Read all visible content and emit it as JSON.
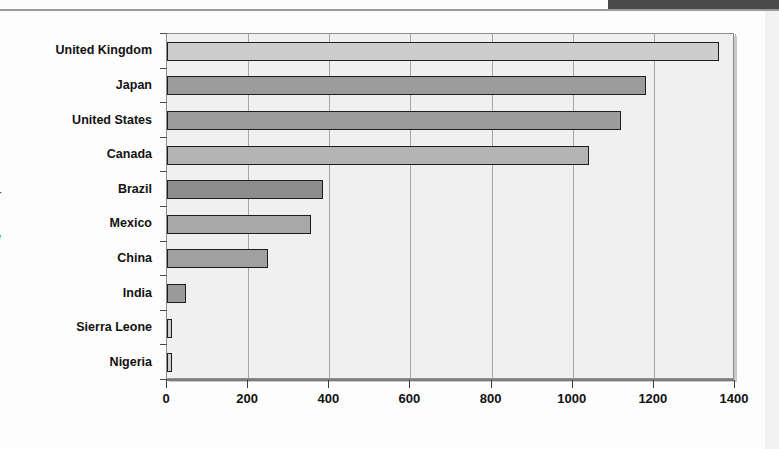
{
  "page": {
    "background_color": "#fdfdfd",
    "top_band_color": "#4a4a4a",
    "edge_glyphs": [
      "r",
      "d"
    ]
  },
  "chart_data": {
    "type": "bar",
    "orientation": "horizontal",
    "title": "",
    "subtitle": "",
    "xlabel": "",
    "ylabel": "",
    "categories": [
      "United Kingdom",
      "Japan",
      "United States",
      "Canada",
      "Brazil",
      "Mexico",
      "China",
      "India",
      "Sierra Leone",
      "Nigeria"
    ],
    "values": [
      1360,
      1180,
      1120,
      1040,
      385,
      355,
      248,
      48,
      12,
      13
    ],
    "series": [
      {
        "name": "",
        "values": [
          1360,
          1180,
          1120,
          1040,
          385,
          355,
          248,
          48,
          12,
          13
        ]
      }
    ],
    "xlim": [
      0,
      1400
    ],
    "xticks": [
      0,
      200,
      400,
      600,
      800,
      1000,
      1200,
      1400
    ],
    "xticklabels": [
      "0",
      "200",
      "400",
      "600",
      "800",
      "1000",
      "1200",
      "1400"
    ],
    "grid": "vertical",
    "legend": "none",
    "bar_colors": [
      "#cdcdcd",
      "#9c9c9c",
      "#9c9c9c",
      "#b4b4b4",
      "#8d8d8d",
      "#a8a8a8",
      "#a0a0a0",
      "#9a9a9a",
      "#cfcfcf",
      "#cfcfcf"
    ],
    "bar_edge_color": "#1d1d1d",
    "plot_background": "#f0f0f0",
    "gridline_color": "#a7a7a7",
    "axis_color": "#7d7d7d"
  }
}
